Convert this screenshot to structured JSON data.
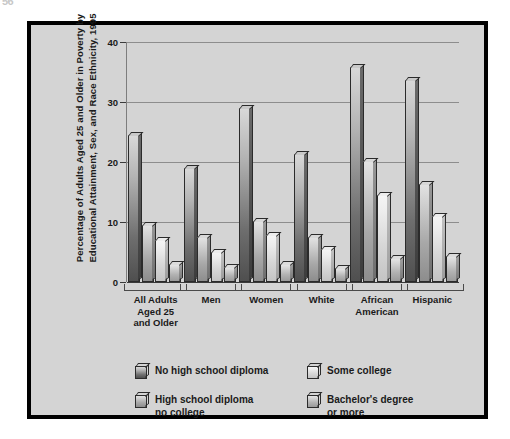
{
  "page": {
    "corner_mark": "56",
    "background_color": "#ffffff",
    "panel_color": "#d4d4d4",
    "frame_color": "#000000"
  },
  "chart_data": {
    "type": "bar",
    "title": "",
    "xlabel": "",
    "ylabel": "Percentage of Adults Aged 25 and Older in Poverty by Educational Attainment, Sex, and Race Ethnicity, 1995",
    "ylim": [
      0,
      40
    ],
    "yticks": [
      0,
      10,
      20,
      30,
      40
    ],
    "ytick_labels": [
      "0",
      "10",
      "20",
      "30",
      "40"
    ],
    "grid": true,
    "legend_position": "bottom",
    "categories": [
      "All Adults\nAged 25\nand Older",
      "Men",
      "Women",
      "White",
      "African\nAmerican",
      "Hispanic"
    ],
    "series": [
      {
        "name": "No high school diploma",
        "color": "#6e6e6e",
        "values": [
          24.5,
          19.0,
          29.0,
          21.3,
          35.8,
          33.6
        ]
      },
      {
        "name": "High school diploma no college",
        "color": "#a8a8a8",
        "values": [
          9.5,
          7.5,
          10.2,
          7.5,
          20.2,
          16.3
        ]
      },
      {
        "name": "Some college",
        "color": "#d9d9d9",
        "values": [
          7.0,
          5.0,
          7.8,
          5.5,
          14.5,
          11.0
        ]
      },
      {
        "name": "Bachelor's degree or more",
        "color": "#b2b2b2",
        "values": [
          3.0,
          2.5,
          3.0,
          2.3,
          4.0,
          4.3
        ]
      }
    ]
  },
  "legend": {
    "items": [
      {
        "label": "No high school diploma",
        "series_index": 0
      },
      {
        "label": "Some college",
        "series_index": 2
      },
      {
        "label": "High school diploma\nno college",
        "series_index": 1
      },
      {
        "label": "Bachelor's degree\nor more",
        "series_index": 3
      }
    ]
  }
}
